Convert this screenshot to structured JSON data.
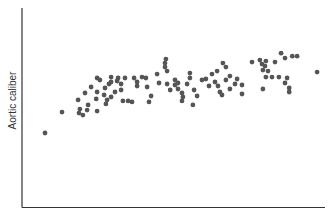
{
  "chart_data": {
    "type": "scatter",
    "title": "",
    "xlabel": "",
    "ylabel": "Aortic caliber",
    "xlim": [
      0,
      100
    ],
    "ylim": [
      0,
      100
    ],
    "grid": false,
    "legend": null,
    "ticks": false,
    "marker_color": "#555555",
    "points": [
      [
        7.6,
        37.2
      ],
      [
        13.2,
        47.7
      ],
      [
        18.8,
        47.2
      ],
      [
        20.1,
        46.2
      ],
      [
        19.1,
        49.2
      ],
      [
        21.5,
        48.7
      ],
      [
        21.8,
        51.3
      ],
      [
        24.8,
        48.2
      ],
      [
        18.5,
        53.8
      ],
      [
        20.8,
        57.3
      ],
      [
        22.8,
        60.3
      ],
      [
        24.5,
        54.3
      ],
      [
        24.8,
        57.8
      ],
      [
        24.8,
        64.8
      ],
      [
        25.7,
        63.8
      ],
      [
        27.4,
        59.8
      ],
      [
        27.1,
        56.3
      ],
      [
        28.1,
        53.8
      ],
      [
        27.7,
        51.8
      ],
      [
        29.4,
        55.3
      ],
      [
        28.7,
        61.8
      ],
      [
        29.4,
        62.8
      ],
      [
        31.4,
        63.3
      ],
      [
        29.4,
        65.3
      ],
      [
        31.7,
        64.8
      ],
      [
        30.7,
        57.8
      ],
      [
        32.7,
        61.8
      ],
      [
        32.7,
        58.8
      ],
      [
        34.0,
        64.8
      ],
      [
        33.3,
        53.3
      ],
      [
        35.0,
        53.3
      ],
      [
        36.3,
        52.8
      ],
      [
        37.0,
        64.8
      ],
      [
        38.0,
        60.8
      ],
      [
        38.0,
        62.8
      ],
      [
        39.6,
        65.3
      ],
      [
        40.9,
        64.8
      ],
      [
        41.3,
        60.3
      ],
      [
        42.6,
        55.8
      ],
      [
        41.9,
        52.8
      ],
      [
        45.2,
        62.3
      ],
      [
        44.6,
        66.8
      ],
      [
        47.2,
        70.3
      ],
      [
        47.2,
        72.3
      ],
      [
        47.5,
        74.3
      ],
      [
        47.9,
        68.3
      ],
      [
        47.9,
        61.8
      ],
      [
        48.9,
        58.8
      ],
      [
        50.5,
        61.3
      ],
      [
        50.5,
        63.8
      ],
      [
        51.5,
        62.3
      ],
      [
        51.5,
        59.3
      ],
      [
        52.8,
        57.3
      ],
      [
        53.1,
        55.3
      ],
      [
        52.8,
        53.3
      ],
      [
        54.5,
        61.8
      ],
      [
        55.4,
        67.3
      ],
      [
        55.4,
        64.8
      ],
      [
        56.8,
        58.8
      ],
      [
        57.8,
        55.8
      ],
      [
        56.4,
        51.3
      ],
      [
        59.4,
        63.8
      ],
      [
        60.7,
        64.3
      ],
      [
        61.7,
        60.8
      ],
      [
        62.7,
        66.8
      ],
      [
        63.7,
        62.8
      ],
      [
        64.7,
        60.8
      ],
      [
        64.4,
        68.3
      ],
      [
        66.3,
        72.3
      ],
      [
        67.3,
        70.3
      ],
      [
        67.3,
        63.8
      ],
      [
        65.3,
        57.8
      ],
      [
        68.6,
        65.8
      ],
      [
        68.6,
        59.3
      ],
      [
        66.0,
        56.3
      ],
      [
        71.0,
        64.3
      ],
      [
        70.3,
        61.8
      ],
      [
        72.6,
        56.8
      ],
      [
        72.6,
        61.3
      ],
      [
        75.9,
        72.8
      ],
      [
        78.5,
        73.8
      ],
      [
        79.2,
        71.8
      ],
      [
        80.2,
        70.8
      ],
      [
        80.5,
        73.3
      ],
      [
        79.5,
        68.8
      ],
      [
        81.2,
        68.3
      ],
      [
        80.5,
        65.3
      ],
      [
        82.5,
        65.3
      ],
      [
        83.5,
        72.8
      ],
      [
        85.5,
        77.3
      ],
      [
        86.8,
        74.8
      ],
      [
        89.2,
        75.8
      ],
      [
        90.8,
        75.8
      ],
      [
        84.8,
        65.3
      ],
      [
        87.5,
        64.8
      ],
      [
        86.8,
        62.3
      ],
      [
        88.2,
        59.8
      ],
      [
        88.2,
        57.8
      ],
      [
        97.4,
        67.8
      ],
      [
        79.5,
        59.3
      ]
    ]
  }
}
